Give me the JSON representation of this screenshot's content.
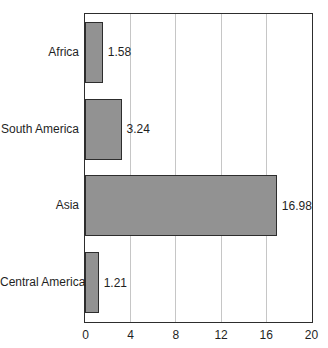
{
  "chart_data": {
    "type": "bar",
    "orientation": "horizontal",
    "title": "",
    "xlabel": "",
    "ylabel": "",
    "categories": [
      "Africa",
      "South America",
      "Asia",
      "Central America"
    ],
    "values": [
      1.58,
      3.24,
      16.98,
      1.21
    ],
    "value_labels": [
      "1.58",
      "3.24",
      "16.98",
      "1.21"
    ],
    "x_ticks": [
      "0",
      "4",
      "8",
      "12",
      "16",
      "20"
    ],
    "x_tick_values": [
      0,
      4,
      8,
      12,
      16,
      20
    ],
    "xlim": [
      0,
      20
    ],
    "grid": "vertical-gridlines-on",
    "legend": "none",
    "colors": {
      "bar_fill": "#929292",
      "bar_border": "#2d2d2d",
      "frame_border": "#2d2d2d",
      "gridline": "#c6c6c6",
      "background": "#ffffff",
      "text": "#1f1f1f"
    }
  }
}
